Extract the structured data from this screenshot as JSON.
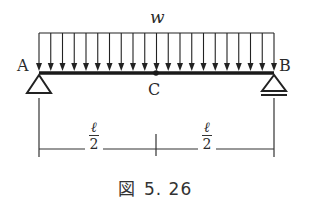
{
  "figure": {
    "load_label": "w",
    "support_left_label": "A",
    "support_right_label": "B",
    "midpoint_label": "C",
    "dimension_left": {
      "numerator": "ℓ",
      "denominator": "2"
    },
    "dimension_right": {
      "numerator": "ℓ",
      "denominator": "2"
    },
    "caption_prefix": "図",
    "caption_number": "5. 26"
  },
  "geometry": {
    "beam_x_start": 39,
    "beam_x_end": 274,
    "beam_y": 73,
    "load_top_y": 33,
    "arrow_count": 21,
    "midpoint_x": 156,
    "dimension_y": 149,
    "line_color": "#222222"
  }
}
